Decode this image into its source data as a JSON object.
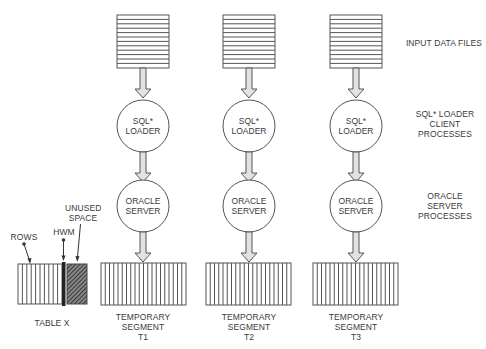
{
  "diagram": {
    "right_labels": {
      "input_data_files": "INPUT DATA FILES",
      "sql_loader_client": [
        "SQL* LOADER",
        "CLIENT",
        "PROCESSES"
      ],
      "oracle_server_processes": [
        "ORACLE",
        "SERVER",
        "PROCESSES"
      ]
    },
    "columns": [
      {
        "loader_label": [
          "SQL*",
          "LOADER"
        ],
        "server_label": [
          "ORACLE",
          "SERVER"
        ],
        "segment_label": [
          "TEMPORARY",
          "SEGMENT",
          "T1"
        ]
      },
      {
        "loader_label": [
          "SQL*",
          "LOADER"
        ],
        "server_label": [
          "ORACLE",
          "SERVER"
        ],
        "segment_label": [
          "TEMPORARY",
          "SEGMENT",
          "T2"
        ]
      },
      {
        "loader_label": [
          "SQL*",
          "LOADER"
        ],
        "server_label": [
          "ORACLE",
          "SERVER"
        ],
        "segment_label": [
          "TEMPORARY",
          "SEGMENT",
          "T3"
        ]
      }
    ],
    "table": {
      "label": "TABLE X",
      "rows_label": "ROWS",
      "hwm_label": "HWM",
      "unused_label": [
        "UNUSED",
        "SPACE"
      ]
    },
    "colors": {
      "line": "#555555",
      "arrow_fill": "#dddddd",
      "hwm": "#222222"
    }
  }
}
